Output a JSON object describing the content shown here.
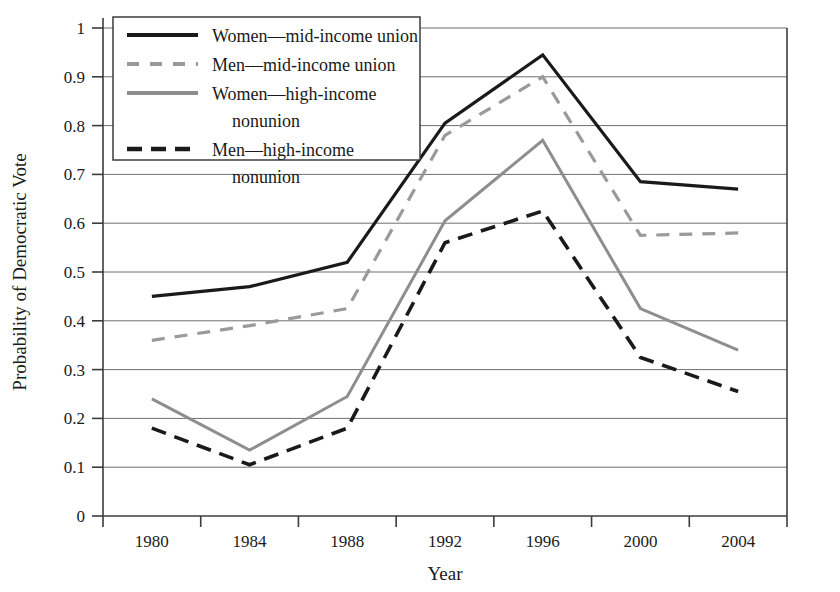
{
  "chart_data": {
    "type": "line",
    "title": "",
    "xlabel": "Year",
    "ylabel": "Probability of Democratic Vote",
    "categories": [
      "1980",
      "1984",
      "1988",
      "1992",
      "1996",
      "2000",
      "2004"
    ],
    "x": [
      1980,
      1984,
      1988,
      1992,
      1996,
      2000,
      2004
    ],
    "ylim": [
      0,
      1
    ],
    "ytick_labels": [
      "0",
      "0.1",
      "0.2",
      "0.3",
      "0.4",
      "0.5",
      "0.6",
      "0.7",
      "0.8",
      "0.9",
      "1"
    ],
    "ytick_values": [
      0,
      0.1,
      0.2,
      0.3,
      0.4,
      0.5,
      0.6,
      0.7,
      0.8,
      0.9,
      1
    ],
    "grid": "horizontal",
    "legend_position": "top-left-inside",
    "series": [
      {
        "name": "Women—mid-income union",
        "style": "solid",
        "color": "#1a1a1a",
        "width": 3.2,
        "values": [
          0.45,
          0.47,
          0.52,
          0.805,
          0.945,
          0.685,
          0.67
        ]
      },
      {
        "name": "Men—mid-income union",
        "style": "dashed",
        "color": "#9a9a9a",
        "width": 3.2,
        "values": [
          0.36,
          0.39,
          0.425,
          0.78,
          0.9,
          0.575,
          0.58
        ]
      },
      {
        "name": "Women—high-income nonunion",
        "style": "solid",
        "color": "#8e8e8e",
        "width": 3.0,
        "values": [
          0.24,
          0.135,
          0.245,
          0.605,
          0.77,
          0.425,
          0.34
        ]
      },
      {
        "name": "Men—high-income nonunion",
        "style": "dashed",
        "color": "#1a1a1a",
        "width": 3.6,
        "values": [
          0.18,
          0.105,
          0.18,
          0.56,
          0.625,
          0.325,
          0.255
        ]
      }
    ]
  },
  "legend": {
    "entries": [
      {
        "line1": "Women—mid-income union",
        "line2": ""
      },
      {
        "line1": "Men—mid-income union",
        "line2": ""
      },
      {
        "line1": "Women—high-income",
        "line2": "nonunion"
      },
      {
        "line1": "Men—high-income",
        "line2": "nonunion"
      }
    ]
  },
  "colors": {
    "axis": "#3c3c3c",
    "grid": "#6e6e6e",
    "dark_series": "#1a1a1a",
    "gray_series": "#8e8e8e",
    "light_gray_series": "#9a9a9a",
    "background": "#ffffff"
  }
}
